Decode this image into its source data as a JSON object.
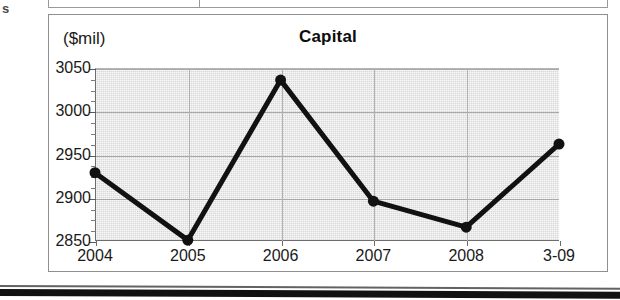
{
  "document": {
    "edge_letter": "s"
  },
  "chart_panel": {
    "unit_label": "($mil)",
    "title": "Capital"
  },
  "chart_data": {
    "type": "line",
    "title": "Capital",
    "subtitle": "",
    "xlabel": "",
    "ylabel": "($mil)",
    "categories": [
      "2004",
      "2005",
      "2006",
      "2007",
      "2008",
      "3-09"
    ],
    "values": [
      2929,
      2851,
      3036,
      2896,
      2866,
      2962
    ],
    "series": [
      {
        "name": "Capital",
        "values": [
          2929,
          2851,
          3036,
          2896,
          2866,
          2962
        ]
      }
    ],
    "ylim": [
      2850,
      3050
    ],
    "ytick_labels": [
      "2850",
      "2900",
      "2950",
      "3000",
      "3050"
    ],
    "ytick_values": [
      2850,
      2900,
      2950,
      3000,
      3050
    ],
    "ytick_interval": 50,
    "yminor_interval": 12.5,
    "xtick_labels": [
      "2004",
      "2005",
      "2006",
      "2007",
      "2008",
      "3-09"
    ],
    "grid": true,
    "grid_axis": "y",
    "legend": false,
    "legend_position": "none",
    "marker": "circle",
    "marker_size": 11,
    "line_width": 5,
    "line_color": "#111111",
    "marker_color": "#111111",
    "plot_background": "#d9d9d9",
    "gridline_color": "#a9a9a9",
    "panel_background": "#ffffff",
    "text_color": "#1a1a1a"
  }
}
